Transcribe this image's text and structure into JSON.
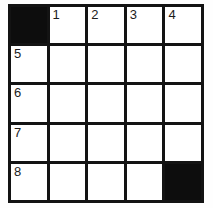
{
  "puzzle": {
    "type": "crossword-grid",
    "rows": 5,
    "columns": 5,
    "colors": {
      "page_background": "#fefefe",
      "grid_line": "#131313",
      "block_cell": "#0d0d0d",
      "open_cell": "#ffffff",
      "clue_number_text": "#1c1c1c"
    },
    "cells": [
      [
        {
          "state": "block",
          "number": "",
          "letter": ""
        },
        {
          "state": "open",
          "number": "1",
          "letter": ""
        },
        {
          "state": "open",
          "number": "2",
          "letter": ""
        },
        {
          "state": "open",
          "number": "3",
          "letter": ""
        },
        {
          "state": "open",
          "number": "4",
          "letter": ""
        }
      ],
      [
        {
          "state": "open",
          "number": "5",
          "letter": ""
        },
        {
          "state": "open",
          "number": "",
          "letter": ""
        },
        {
          "state": "open",
          "number": "",
          "letter": ""
        },
        {
          "state": "open",
          "number": "",
          "letter": ""
        },
        {
          "state": "open",
          "number": "",
          "letter": ""
        }
      ],
      [
        {
          "state": "open",
          "number": "6",
          "letter": ""
        },
        {
          "state": "open",
          "number": "",
          "letter": ""
        },
        {
          "state": "open",
          "number": "",
          "letter": ""
        },
        {
          "state": "open",
          "number": "",
          "letter": ""
        },
        {
          "state": "open",
          "number": "",
          "letter": ""
        }
      ],
      [
        {
          "state": "open",
          "number": "7",
          "letter": ""
        },
        {
          "state": "open",
          "number": "",
          "letter": ""
        },
        {
          "state": "open",
          "number": "",
          "letter": ""
        },
        {
          "state": "open",
          "number": "",
          "letter": ""
        },
        {
          "state": "open",
          "number": "",
          "letter": ""
        }
      ],
      [
        {
          "state": "open",
          "number": "8",
          "letter": ""
        },
        {
          "state": "open",
          "number": "",
          "letter": ""
        },
        {
          "state": "open",
          "number": "",
          "letter": ""
        },
        {
          "state": "open",
          "number": "",
          "letter": ""
        },
        {
          "state": "block",
          "number": "",
          "letter": ""
        }
      ]
    ]
  }
}
